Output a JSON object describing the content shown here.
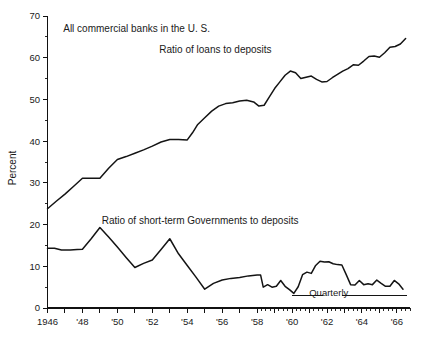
{
  "chart_data": {
    "type": "line",
    "title": "",
    "xlabel": "",
    "ylabel": "Percent",
    "ylim": [
      0,
      70
    ],
    "xlim": [
      1946,
      1966.75
    ],
    "grid": false,
    "legend_position": "inline-annotations",
    "y_ticks_major": [
      0,
      10,
      20,
      30,
      40,
      50,
      60,
      70
    ],
    "y_ticks_minor": [
      5,
      15,
      25,
      35,
      45,
      55,
      65
    ],
    "x_tick_labels": [
      {
        "x": 1946,
        "label": "1946"
      },
      {
        "x": 1948,
        "label": "'48"
      },
      {
        "x": 1950,
        "label": "'50"
      },
      {
        "x": 1952,
        "label": "'52"
      },
      {
        "x": 1954,
        "label": "'54"
      },
      {
        "x": 1956,
        "label": "'56"
      },
      {
        "x": 1958,
        "label": "'58"
      },
      {
        "x": 1960,
        "label": "'60"
      },
      {
        "x": 1962,
        "label": "'62"
      },
      {
        "x": 1964,
        "label": "'64"
      },
      {
        "x": 1966,
        "label": "'66"
      }
    ],
    "x_ticks_annual_from": 1946,
    "x_ticks_annual_to": 1958,
    "x_ticks_quarterly_from": 1958,
    "x_ticks_quarterly_to": 1966.75,
    "annotations": [
      {
        "name": "header-note",
        "text": "All commercial banks in the U. S.",
        "x": 1946.9,
        "y": 66.2
      },
      {
        "name": "loans-series-label",
        "text": "Ratio of loans to deposits",
        "x": 1952.4,
        "y": 61.2
      },
      {
        "name": "governments-series-label",
        "text": "Ratio of short-term Governments to deposits",
        "x": 1949.1,
        "y": 20.2
      },
      {
        "name": "quarterly-note",
        "text": "Quarterly",
        "x": 1962.1,
        "y": 2.9
      }
    ],
    "series": [
      {
        "name": "Ratio of loans to deposits",
        "color": "#141414",
        "points": [
          [
            1946.0,
            23.8
          ],
          [
            1946.5,
            25.6
          ],
          [
            1947.0,
            27.3
          ],
          [
            1947.5,
            29.2
          ],
          [
            1948.0,
            31.1
          ],
          [
            1948.5,
            31.1
          ],
          [
            1949.0,
            31.1
          ],
          [
            1949.5,
            33.5
          ],
          [
            1950.0,
            35.6
          ],
          [
            1950.5,
            36.3
          ],
          [
            1951.0,
            37.1
          ],
          [
            1951.5,
            37.9
          ],
          [
            1952.0,
            38.8
          ],
          [
            1952.5,
            39.8
          ],
          [
            1953.0,
            40.4
          ],
          [
            1953.5,
            40.4
          ],
          [
            1954.0,
            40.3
          ],
          [
            1954.3,
            42.0
          ],
          [
            1954.6,
            44.0
          ],
          [
            1955.0,
            45.6
          ],
          [
            1955.4,
            47.2
          ],
          [
            1955.8,
            48.4
          ],
          [
            1956.2,
            49.0
          ],
          [
            1956.6,
            49.2
          ],
          [
            1957.0,
            49.6
          ],
          [
            1957.4,
            49.8
          ],
          [
            1957.8,
            49.4
          ],
          [
            1958.1,
            48.4
          ],
          [
            1958.4,
            48.6
          ],
          [
            1958.7,
            50.6
          ],
          [
            1959.0,
            52.6
          ],
          [
            1959.3,
            54.2
          ],
          [
            1959.6,
            55.8
          ],
          [
            1959.9,
            56.8
          ],
          [
            1960.2,
            56.4
          ],
          [
            1960.5,
            55.0
          ],
          [
            1960.8,
            55.3
          ],
          [
            1961.1,
            55.6
          ],
          [
            1961.4,
            54.8
          ],
          [
            1961.7,
            54.2
          ],
          [
            1962.0,
            54.3
          ],
          [
            1962.3,
            55.2
          ],
          [
            1962.6,
            56.0
          ],
          [
            1962.9,
            56.8
          ],
          [
            1963.2,
            57.4
          ],
          [
            1963.5,
            58.3
          ],
          [
            1963.8,
            58.2
          ],
          [
            1964.1,
            59.2
          ],
          [
            1964.4,
            60.3
          ],
          [
            1964.7,
            60.4
          ],
          [
            1965.0,
            60.1
          ],
          [
            1965.3,
            61.2
          ],
          [
            1965.6,
            62.5
          ],
          [
            1965.9,
            62.7
          ],
          [
            1966.2,
            63.3
          ],
          [
            1966.5,
            64.6
          ]
        ]
      },
      {
        "name": "Ratio of short-term Governments to deposits",
        "color": "#141414",
        "points": [
          [
            1946.0,
            14.3
          ],
          [
            1946.4,
            14.3
          ],
          [
            1946.8,
            13.9
          ],
          [
            1947.3,
            13.9
          ],
          [
            1947.7,
            14.0
          ],
          [
            1948.0,
            14.1
          ],
          [
            1948.5,
            16.6
          ],
          [
            1949.0,
            19.3
          ],
          [
            1949.5,
            17.0
          ],
          [
            1950.0,
            14.6
          ],
          [
            1950.5,
            12.1
          ],
          [
            1951.0,
            9.7
          ],
          [
            1951.5,
            10.7
          ],
          [
            1952.0,
            11.5
          ],
          [
            1952.5,
            14.0
          ],
          [
            1953.0,
            16.6
          ],
          [
            1953.5,
            13.0
          ],
          [
            1954.0,
            10.2
          ],
          [
            1954.5,
            7.4
          ],
          [
            1955.0,
            4.5
          ],
          [
            1955.5,
            5.9
          ],
          [
            1956.0,
            6.7
          ],
          [
            1956.5,
            7.1
          ],
          [
            1957.0,
            7.3
          ],
          [
            1957.5,
            7.7
          ],
          [
            1958.0,
            7.9
          ],
          [
            1958.2,
            7.9
          ],
          [
            1958.35,
            5.0
          ],
          [
            1958.6,
            5.6
          ],
          [
            1958.85,
            5.0
          ],
          [
            1959.1,
            5.2
          ],
          [
            1959.35,
            6.6
          ],
          [
            1959.6,
            5.2
          ],
          [
            1959.85,
            4.4
          ],
          [
            1960.1,
            3.5
          ],
          [
            1960.35,
            5.1
          ],
          [
            1960.6,
            8.0
          ],
          [
            1960.85,
            8.6
          ],
          [
            1961.1,
            8.3
          ],
          [
            1961.35,
            10.2
          ],
          [
            1961.6,
            11.2
          ],
          [
            1961.85,
            11.0
          ],
          [
            1962.1,
            11.1
          ],
          [
            1962.35,
            10.6
          ],
          [
            1962.6,
            10.4
          ],
          [
            1962.85,
            10.3
          ],
          [
            1963.1,
            8.0
          ],
          [
            1963.35,
            5.6
          ],
          [
            1963.6,
            5.5
          ],
          [
            1963.85,
            6.6
          ],
          [
            1964.1,
            5.6
          ],
          [
            1964.35,
            5.8
          ],
          [
            1964.6,
            5.6
          ],
          [
            1964.85,
            6.7
          ],
          [
            1965.1,
            5.9
          ],
          [
            1965.35,
            5.2
          ],
          [
            1965.6,
            5.2
          ],
          [
            1965.85,
            6.6
          ],
          [
            1966.1,
            5.8
          ],
          [
            1966.35,
            4.5
          ]
        ]
      }
    ],
    "rules": [
      {
        "name": "quarterly-rule-left",
        "x1": 1960.0,
        "x2": 1961.75,
        "y": 3.0
      },
      {
        "name": "quarterly-rule-right",
        "x1": 1962.85,
        "x2": 1966.6,
        "y": 3.0
      }
    ]
  }
}
